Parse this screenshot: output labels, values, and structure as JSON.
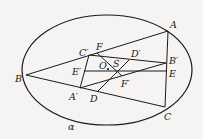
{
  "diagram": {
    "title": "",
    "ellipse": {
      "label": "α",
      "cx": 107,
      "cy": 70,
      "rx": 85,
      "ry": 55
    },
    "points": {
      "A": {
        "label": "A",
        "x": 168,
        "y": 31
      },
      "B": {
        "label": "B",
        "x": 26,
        "y": 75
      },
      "C": {
        "label": "C",
        "x": 165,
        "y": 107
      },
      "A'": {
        "label": "A′",
        "x": 80,
        "y": 88
      },
      "B'": {
        "label": "B′",
        "x": 166,
        "y": 63
      },
      "C'": {
        "label": "C′",
        "x": 89,
        "y": 55
      },
      "D": {
        "label": "D",
        "x": 97,
        "y": 92
      },
      "D'": {
        "label": "D′",
        "x": 129,
        "y": 60
      },
      "E": {
        "label": "E",
        "x": 166,
        "y": 71
      },
      "E'": {
        "label": "E′",
        "x": 84,
        "y": 71
      },
      "F": {
        "label": "F",
        "x": 97,
        "y": 53
      },
      "F'": {
        "label": "F′",
        "x": 122,
        "y": 77
      },
      "O": {
        "label": "O",
        "x": 108,
        "y": 68
      },
      "S": {
        "label": "S",
        "x": 116,
        "y": 70
      }
    },
    "segments": [
      [
        "B",
        "A"
      ],
      [
        "B",
        "C"
      ],
      [
        "A",
        "C"
      ],
      [
        "C'",
        "A'"
      ],
      [
        "C'",
        "B'"
      ],
      [
        "A'",
        "B'"
      ],
      [
        "E'",
        "E"
      ],
      [
        "F",
        "F'"
      ],
      [
        "D",
        "D'"
      ]
    ]
  }
}
